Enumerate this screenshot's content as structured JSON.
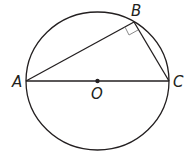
{
  "diagram": {
    "type": "circle-inscribed-right-triangle",
    "points": {
      "A": {
        "label": "A",
        "role": "diameter endpoint"
      },
      "B": {
        "label": "B",
        "role": "point on circle"
      },
      "C": {
        "label": "C",
        "role": "diameter endpoint"
      },
      "O": {
        "label": "O",
        "role": "center"
      }
    },
    "segments": [
      "AB",
      "BC",
      "AC"
    ],
    "right_angle_at": "B",
    "colors": {
      "ink": "#231f20",
      "right_angle_marker": "#8a8a8a"
    }
  }
}
